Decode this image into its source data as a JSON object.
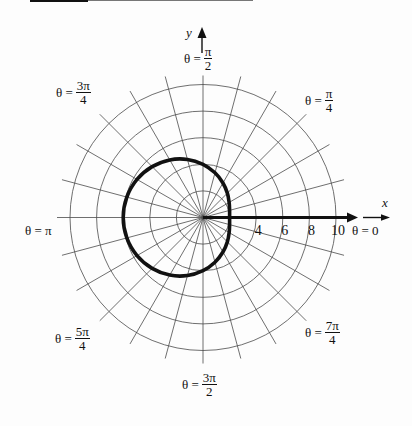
{
  "chart_data": {
    "type": "polar",
    "title": "",
    "axis_labels": {
      "x": "x",
      "y": "y"
    },
    "grid": true,
    "grid_circles_r": [
      2,
      4,
      6,
      8,
      10
    ],
    "spoke_step_deg": 15,
    "r_max": 10,
    "r_ticks": [
      4,
      6,
      8,
      10
    ],
    "r_tick_labels": [
      "4",
      "6",
      "8",
      "10"
    ],
    "curve": {
      "style": "thick black closed curve",
      "theta_deg": [
        0,
        15,
        30,
        45,
        60,
        75,
        90,
        105,
        120,
        135,
        150,
        165,
        180,
        195,
        210,
        225,
        240,
        255,
        270,
        285,
        300,
        315,
        330,
        345
      ],
      "r": [
        2.0,
        2.07,
        2.27,
        2.59,
        3.0,
        3.48,
        4.0,
        4.52,
        5.0,
        5.41,
        5.73,
        5.93,
        6.0,
        5.93,
        5.73,
        5.41,
        5.0,
        4.52,
        4.0,
        3.48,
        3.0,
        2.59,
        2.27,
        2.07
      ]
    },
    "angle_labels": [
      {
        "prefix": "θ =",
        "num": "π",
        "den": "2"
      },
      {
        "prefix": "θ =",
        "num": "3π",
        "den": "4"
      },
      {
        "prefix": "θ =",
        "num": "π",
        "den": "4"
      },
      {
        "text": "θ = π"
      },
      {
        "text": "θ = 0"
      },
      {
        "prefix": "θ =",
        "num": "5π",
        "den": "4"
      },
      {
        "prefix": "θ =",
        "num": "7π",
        "den": "4"
      },
      {
        "prefix": "θ =",
        "num": "3π",
        "den": "2"
      }
    ]
  }
}
